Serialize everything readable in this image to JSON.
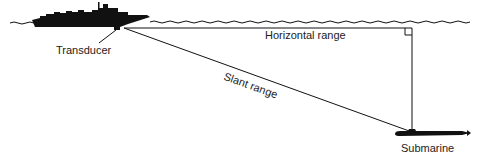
{
  "diagram": {
    "labels": {
      "transducer": "Transducer",
      "horizontal_range": "Horizontal range",
      "slant_range": "Slant range",
      "submarine": "Submarine"
    },
    "elements": {
      "ship": "ship-silhouette",
      "submarine": "submarine-silhouette",
      "sea_surface": "wavy-waterline",
      "right_angle_marker": "right-angle-marker"
    },
    "colors": {
      "ink": "#111111",
      "text": "#222222",
      "background": "#ffffff"
    }
  }
}
